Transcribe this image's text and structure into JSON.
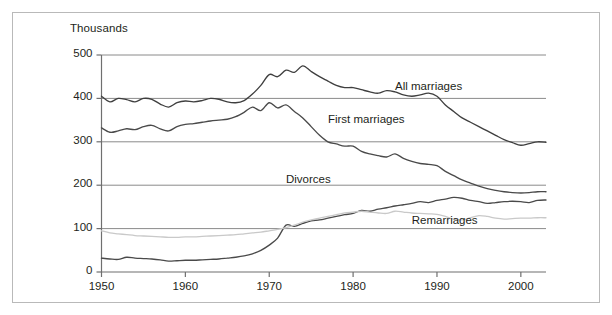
{
  "chart_data": {
    "type": "line",
    "title": "",
    "subtitle": "",
    "xlabel": "",
    "ylabel": "Thousands",
    "ylim": [
      0,
      500
    ],
    "xlim": [
      1950,
      2003
    ],
    "grid": "horizontal",
    "legend_position": "inline-annotations",
    "y_ticks": [
      0,
      100,
      200,
      300,
      400,
      500
    ],
    "y_tick_labels": [
      "0",
      "100",
      "200",
      "300",
      "400",
      "500"
    ],
    "x_ticks": [
      1950,
      1960,
      1970,
      1980,
      1990,
      2000
    ],
    "x_tick_labels": [
      "1950",
      "1960",
      "1970",
      "1980",
      "1990",
      "2000"
    ],
    "x": [
      1950,
      1951,
      1952,
      1953,
      1954,
      1955,
      1956,
      1957,
      1958,
      1959,
      1960,
      1961,
      1962,
      1963,
      1964,
      1965,
      1966,
      1967,
      1968,
      1969,
      1970,
      1971,
      1972,
      1973,
      1974,
      1975,
      1976,
      1977,
      1978,
      1979,
      1980,
      1981,
      1982,
      1983,
      1984,
      1985,
      1986,
      1987,
      1988,
      1989,
      1990,
      1991,
      1992,
      1993,
      1994,
      1995,
      1996,
      1997,
      1998,
      1999,
      2000,
      2001,
      2002,
      2003
    ],
    "series": [
      {
        "name": "All marriages",
        "color": "#3f3f3f",
        "label_x": 1985,
        "label_y": 425,
        "values": [
          405,
          392,
          400,
          397,
          392,
          400,
          398,
          387,
          380,
          390,
          394,
          392,
          395,
          400,
          398,
          392,
          390,
          395,
          410,
          430,
          455,
          450,
          465,
          460,
          475,
          462,
          450,
          440,
          430,
          425,
          425,
          420,
          415,
          412,
          418,
          415,
          408,
          405,
          408,
          412,
          405,
          385,
          370,
          355,
          345,
          335,
          325,
          315,
          305,
          298,
          292,
          296,
          300,
          299
        ]
      },
      {
        "name": "First marriages",
        "color": "#4a4a4a",
        "label_x": 1977,
        "label_y": 348,
        "values": [
          332,
          322,
          325,
          330,
          328,
          335,
          338,
          330,
          325,
          335,
          340,
          342,
          345,
          348,
          350,
          352,
          358,
          368,
          380,
          372,
          390,
          378,
          385,
          370,
          355,
          335,
          315,
          300,
          295,
          290,
          290,
          278,
          272,
          268,
          265,
          272,
          262,
          255,
          250,
          248,
          245,
          232,
          222,
          212,
          205,
          198,
          192,
          188,
          185,
          183,
          182,
          183,
          185,
          185
        ]
      },
      {
        "name": "Divorces",
        "color": "#4a4a4a",
        "label_x": 1972,
        "label_y": 210,
        "values": [
          32,
          30,
          29,
          34,
          32,
          31,
          30,
          28,
          25,
          26,
          27,
          27,
          28,
          29,
          30,
          32,
          34,
          37,
          42,
          50,
          62,
          78,
          108,
          105,
          112,
          118,
          120,
          124,
          128,
          132,
          135,
          142,
          140,
          145,
          148,
          152,
          155,
          158,
          162,
          160,
          165,
          168,
          172,
          170,
          165,
          162,
          158,
          160,
          162,
          163,
          162,
          160,
          165,
          166
        ]
      },
      {
        "name": "Remarriages",
        "color": "#c9c9c9",
        "label_x": 1987,
        "label_y": 115,
        "values": [
          95,
          90,
          88,
          86,
          84,
          83,
          82,
          81,
          80,
          80,
          81,
          81,
          82,
          83,
          84,
          85,
          86,
          88,
          90,
          92,
          95,
          98,
          102,
          108,
          115,
          120,
          124,
          128,
          132,
          136,
          138,
          140,
          138,
          136,
          135,
          140,
          138,
          136,
          135,
          134,
          133,
          128,
          122,
          120,
          125,
          130,
          128,
          124,
          122,
          123,
          124,
          124,
          125,
          125
        ]
      }
    ]
  },
  "axis": {
    "y_title": "Thousands"
  },
  "colors": {
    "axis": "#6f6f6f",
    "grid": "#8a8a8a",
    "frame": "#b9b9b9",
    "text": "#231f20",
    "dark_line": "#3f3f3f",
    "light_line": "#c9c9c9"
  }
}
